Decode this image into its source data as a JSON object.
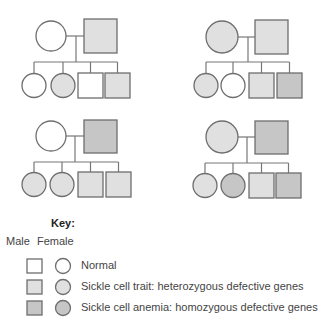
{
  "colors": {
    "normal": "#ffffff",
    "trait": "#e0e0e0",
    "anemia": "#c6c6c6",
    "stroke": "#6e6e6e",
    "line": "#777777"
  },
  "pedigrees": [
    {
      "id": "top-left",
      "mother": {
        "status": "normal",
        "cx": 51,
        "cy": 36,
        "r": 15
      },
      "father": {
        "status": "trait",
        "x": 84,
        "y": 19,
        "w": 33,
        "h": 34
      },
      "drop_x": 76,
      "marriage_y": 36,
      "sib_y": 62,
      "children": [
        {
          "sex": "female",
          "status": "normal",
          "cx": 34
        },
        {
          "sex": "female",
          "status": "trait",
          "cx": 63
        },
        {
          "sex": "male",
          "status": "normal",
          "x": 78
        },
        {
          "sex": "male",
          "status": "trait",
          "x": 105
        }
      ],
      "child_top": 73,
      "child_size": 25
    },
    {
      "id": "top-right",
      "mother": {
        "status": "trait",
        "cx": 222,
        "cy": 37,
        "r": 16
      },
      "father": {
        "status": "trait",
        "x": 255,
        "y": 20,
        "w": 33,
        "h": 34
      },
      "drop_x": 248,
      "marriage_y": 37,
      "sib_y": 62,
      "children": [
        {
          "sex": "female",
          "status": "trait",
          "cx": 206
        },
        {
          "sex": "female",
          "status": "normal",
          "cx": 233
        },
        {
          "sex": "male",
          "status": "trait",
          "x": 249
        },
        {
          "sex": "male",
          "status": "anemia",
          "x": 277
        }
      ],
      "child_top": 73,
      "child_size": 25
    },
    {
      "id": "bottom-left",
      "mother": {
        "status": "normal",
        "cx": 51,
        "cy": 136,
        "r": 15
      },
      "father": {
        "status": "anemia",
        "x": 84,
        "y": 120,
        "w": 33,
        "h": 33
      },
      "drop_x": 75,
      "marriage_y": 136,
      "sib_y": 162,
      "children": [
        {
          "sex": "female",
          "status": "trait",
          "cx": 34
        },
        {
          "sex": "female",
          "status": "trait",
          "cx": 62
        },
        {
          "sex": "male",
          "status": "trait",
          "x": 78
        },
        {
          "sex": "male",
          "status": "trait",
          "x": 106
        }
      ],
      "child_top": 172,
      "child_size": 25
    },
    {
      "id": "bottom-right",
      "mother": {
        "status": "trait",
        "cx": 222,
        "cy": 137,
        "r": 16
      },
      "father": {
        "status": "anemia",
        "x": 255,
        "y": 121,
        "w": 33,
        "h": 33
      },
      "drop_x": 247,
      "marriage_y": 137,
      "sib_y": 163,
      "children": [
        {
          "sex": "female",
          "status": "trait",
          "cx": 205
        },
        {
          "sex": "female",
          "status": "anemia",
          "cx": 233
        },
        {
          "sex": "male",
          "status": "trait",
          "x": 249
        },
        {
          "sex": "male",
          "status": "anemia",
          "x": 276
        }
      ],
      "child_top": 173,
      "child_size": 25
    }
  ],
  "key": {
    "title": "Key:",
    "male_label": "Male",
    "female_label": "Female",
    "rows": [
      {
        "status": "normal",
        "label": "Normal",
        "y": 259
      },
      {
        "status": "trait",
        "label": "Sickle cell trait: heterozygous defective genes",
        "y": 280
      },
      {
        "status": "anemia",
        "label": "Sickle cell anemia: homozygous defective genes",
        "y": 301
      }
    ]
  }
}
